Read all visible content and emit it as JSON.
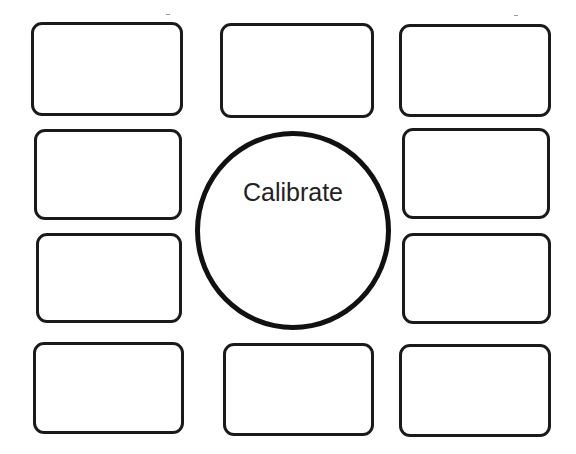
{
  "diagram": {
    "center": {
      "label": "Calibrate",
      "shape": "circle"
    },
    "boxes": [
      {
        "id": "top-left",
        "label": ""
      },
      {
        "id": "top-middle",
        "label": ""
      },
      {
        "id": "top-right",
        "label": ""
      },
      {
        "id": "middle-left-upper",
        "label": ""
      },
      {
        "id": "middle-right-upper",
        "label": ""
      },
      {
        "id": "middle-left-lower",
        "label": ""
      },
      {
        "id": "middle-right-lower",
        "label": ""
      },
      {
        "id": "bottom-left",
        "label": ""
      },
      {
        "id": "bottom-middle",
        "label": ""
      },
      {
        "id": "bottom-right",
        "label": ""
      }
    ],
    "colors": {
      "stroke": "#1a1a1a",
      "background": "#ffffff",
      "text": "#222222"
    }
  }
}
